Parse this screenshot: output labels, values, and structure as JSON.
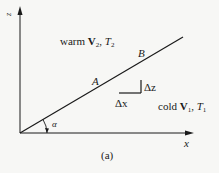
{
  "figure": {
    "caption": "(a)",
    "axes": {
      "x_label": "x",
      "z_label": "z"
    },
    "angle_label": "α",
    "points": {
      "A": "A",
      "B": "B"
    },
    "deltas": {
      "dx": "Δx",
      "dz": "Δz"
    },
    "regions": {
      "warm": {
        "word": "warm",
        "vector": "V",
        "vector_sub": "2",
        "sep": ",",
        "temp": "T",
        "temp_sub": "2"
      },
      "cold": {
        "word": "cold",
        "vector": "V",
        "vector_sub": "1",
        "sep": ",",
        "temp": "T",
        "temp_sub": "1"
      }
    },
    "colors": {
      "ink": "#1a1a1a",
      "background": "#f7f7f5"
    }
  }
}
